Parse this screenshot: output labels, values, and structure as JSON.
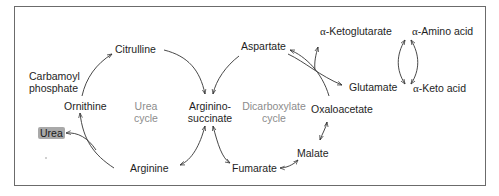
{
  "diagram": {
    "type": "metabolic-pathway",
    "colors": {
      "border": "#6b6b6b",
      "text": "#1e1e1e",
      "cycle_label": "#8c8c8c",
      "urea_badge_bg": "#a9a9a9",
      "arrow": "#333333"
    },
    "cycles": {
      "urea": {
        "line1": "Urea",
        "line2": "cycle"
      },
      "dicarboxylate": {
        "line1": "Dicarboxylate",
        "line2": "cycle"
      }
    },
    "nodes": {
      "citrulline": "Citrulline",
      "carbamoyl_phosphate": {
        "line1": "Carbamoyl",
        "line2": "phosphate"
      },
      "ornithine": "Ornithine",
      "urea": "Urea",
      "arginine": "Arginine",
      "argininosuccinate": {
        "line1": "Arginino-",
        "line2": "succinate"
      },
      "aspartate": "Aspartate",
      "fumarate": "Fumarate",
      "malate": "Malate",
      "oxaloacetate": "Oxaloacetate",
      "glutamate": "Glutamate",
      "alpha_ketoglutarate": {
        "prefix": "α",
        "name": "-Ketoglutarate"
      },
      "alpha_amino_acid": {
        "prefix": "α",
        "name": "-Amino acid"
      },
      "alpha_keto_acid": {
        "prefix": "α",
        "name": "-Keto acid"
      }
    },
    "edges": [
      {
        "from": "Ornithine",
        "to": "Citrulline",
        "cofactor_in": "Carbamoyl phosphate"
      },
      {
        "from": "Citrulline",
        "to": "Argininosuccinate"
      },
      {
        "from": "Aspartate",
        "to": "Argininosuccinate"
      },
      {
        "from": "Argininosuccinate",
        "to": "Arginine",
        "reversible": true
      },
      {
        "from": "Argininosuccinate",
        "to": "Fumarate",
        "reversible": true
      },
      {
        "from": "Arginine",
        "to": "Ornithine",
        "cofactor_out": "Urea"
      },
      {
        "from": "Fumarate",
        "to": "Malate",
        "reversible": true
      },
      {
        "from": "Malate",
        "to": "Oxaloacetate",
        "reversible": true
      },
      {
        "from": "Oxaloacetate",
        "to": "Aspartate",
        "paired_with": "Glutamate ⇄ α-Ketoglutarate"
      },
      {
        "from": "α-Amino acid",
        "to": "α-Keto acid",
        "paired_with": "α-Ketoglutarate ⇄ Glutamate"
      }
    ]
  }
}
